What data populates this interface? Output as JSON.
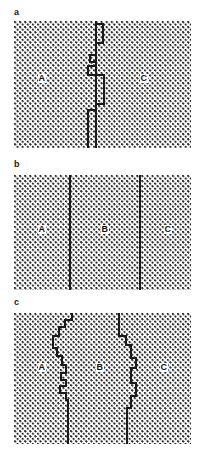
{
  "figure": {
    "kind": "grain-boundary-diagram",
    "width": 205,
    "height": 459,
    "background": "#ffffff",
    "ink_color": "#1a1a1a",
    "stipple_color": "#262626"
  },
  "panels": [
    {
      "id": "a",
      "letter": "a",
      "letter_x": 14,
      "letter_y": 8,
      "field": {
        "x": 14,
        "y": 21,
        "w": 177,
        "h": 127
      },
      "description": "faceted boundary with rectangular ledges separating two regions",
      "regions": [
        {
          "label": "A",
          "x": 38,
          "y": 74
        },
        {
          "label": "C",
          "x": 140,
          "y": 74
        }
      ],
      "boundaries": [
        {
          "name": "faceted-boundary",
          "points": "96,21 96,148"
        },
        {
          "name": "ledge-1",
          "points": "96,24 103,24 103,43 96,43"
        },
        {
          "name": "ledge-2",
          "points": "96,55 90,55 90,62 96,62"
        },
        {
          "name": "ledge-3",
          "points": "96,66 88,66 88,75 96,75"
        },
        {
          "name": "ledge-4",
          "points": "96,75 104,75 104,104 96,104"
        },
        {
          "name": "ledge-5",
          "points": "96,110 88,110 88,148"
        }
      ]
    },
    {
      "id": "b",
      "letter": "b",
      "letter_x": 14,
      "letter_y": 160,
      "field": {
        "x": 14,
        "y": 175,
        "w": 177,
        "h": 115
      },
      "description": "two perfectly straight vertical boundaries separating three regions",
      "regions": [
        {
          "label": "A",
          "x": 38,
          "y": 229
        },
        {
          "label": "B",
          "x": 101,
          "y": 229
        },
        {
          "label": "C",
          "x": 164,
          "y": 229
        }
      ],
      "boundaries": [
        {
          "name": "straight-boundary-left",
          "points": "70,175 70,290"
        },
        {
          "name": "straight-boundary-right",
          "points": "140,175 140,290"
        }
      ]
    },
    {
      "id": "c",
      "letter": "c",
      "letter_x": 14,
      "letter_y": 298,
      "field": {
        "x": 14,
        "y": 313,
        "w": 177,
        "h": 131
      },
      "description": "two irregular staircase boundaries separating three regions",
      "regions": [
        {
          "label": "A",
          "x": 38,
          "y": 371
        },
        {
          "label": "B",
          "x": 96,
          "y": 371
        },
        {
          "label": "C",
          "x": 160,
          "y": 371
        }
      ],
      "boundaries": [
        {
          "name": "jagged-boundary-left",
          "points": "72,313 72,320 65,320 65,327 59,327 59,336 53,336 53,348 57,348 57,356 62,356 62,365 66,365 66,373 61,373 61,380 66,380 66,386 60,386 60,393 66,393 66,400 68,400 68,444"
        },
        {
          "name": "jagged-boundary-right",
          "points": "119,313 119,336 126,336 126,345 131,345 131,358 136,358 136,368 131,368 131,383 136,383 136,396 131,396 131,408 127,408 127,444"
        }
      ]
    }
  ]
}
